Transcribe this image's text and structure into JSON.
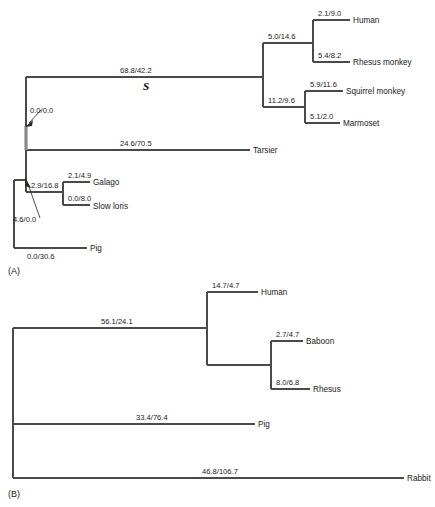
{
  "figure": {
    "panels": [
      {
        "id": "A",
        "label": "(A)",
        "node_marker": "S",
        "taxa": [
          "Human",
          "Rhesus monkey",
          "Squirrel monkey",
          "Marmoset",
          "Tarsier",
          "Galago",
          "Slow loris",
          "Pig"
        ],
        "branch_labels": [
          {
            "name": "human-branch-length",
            "text": "2.1/9.0"
          },
          {
            "name": "rhesus-monkey-branch-length",
            "text": "5.4/8.2"
          },
          {
            "name": "catarrhine-branch-length",
            "text": "5.0/14.6"
          },
          {
            "name": "squirrel-monkey-branch-length",
            "text": "5.9/11.6"
          },
          {
            "name": "marmoset-branch-length",
            "text": "5.1/2.0"
          },
          {
            "name": "platyrrhine-branch-length",
            "text": "11.2/9.6"
          },
          {
            "name": "anthropoid-branch-length",
            "text": "68.8/42.2"
          },
          {
            "name": "tarsier-branch-length",
            "text": "24.6/70.5"
          },
          {
            "name": "haplorhine-branch-length",
            "text": "0.0/0.0"
          },
          {
            "name": "galago-branch-length",
            "text": "2.1/4.9"
          },
          {
            "name": "slow-loris-branch-length",
            "text": "0.0/8.0"
          },
          {
            "name": "strepsirrhine-branch-length",
            "text": "2.9/16.8"
          },
          {
            "name": "primate-root-branch-length",
            "text": "4.6/0.0"
          },
          {
            "name": "pig-branch-length",
            "text": "0.0/30.6"
          }
        ]
      },
      {
        "id": "B",
        "label": "(B)",
        "taxa": [
          "Human",
          "Baboon",
          "Rhesus",
          "Pig",
          "Rabbit"
        ],
        "branch_labels": [
          {
            "name": "human-branch-length",
            "text": "14.7/4.7"
          },
          {
            "name": "baboon-branch-length",
            "text": "2.7/4.7"
          },
          {
            "name": "rhesus-branch-length",
            "text": "8.0/6.8"
          },
          {
            "name": "primate-branch-length",
            "text": "56.1/24.1"
          },
          {
            "name": "pig-branch-length",
            "text": "33.4/76.4"
          },
          {
            "name": "rabbit-branch-length",
            "text": "46.8/106.7"
          }
        ]
      }
    ],
    "panelA": {
      "label": "(A)",
      "node_marker": "S",
      "taxon_human": "Human",
      "taxon_rhesus_monkey": "Rhesus monkey",
      "taxon_squirrel_monkey": "Squirrel monkey",
      "taxon_marmoset": "Marmoset",
      "taxon_tarsier": "Tarsier",
      "taxon_galago": "Galago",
      "taxon_slow_loris": "Slow loris",
      "taxon_pig": "Pig",
      "len_human": "2.1/9.0",
      "len_rhesus_monkey": "5.4/8.2",
      "len_catarrhine": "5.0/14.6",
      "len_squirrel_monkey": "5.9/11.6",
      "len_marmoset": "5.1/2.0",
      "len_platyrrhine": "11.2/9.6",
      "len_anthropoid": "68.8/42.2",
      "len_tarsier": "24.6/70.5",
      "len_haplorhine": "0.0/0.0",
      "len_galago": "2.1/4.9",
      "len_slow_loris": "0.0/8.0",
      "len_strepsirrhine": "2.9/16.8",
      "len_primate_root": "4.6/0.0",
      "len_pig": "0.0/30.6"
    },
    "panelB": {
      "label": "(B)",
      "taxon_human": "Human",
      "taxon_baboon": "Baboon",
      "taxon_rhesus": "Rhesus",
      "taxon_pig": "Pig",
      "taxon_rabbit": "Rabbit",
      "len_human": "14.7/4.7",
      "len_baboon": "2.7/4.7",
      "len_rhesus": "8.0/6.8",
      "len_primate": "56.1/24.1",
      "len_pig": "33.4/76.4",
      "len_rabbit": "46.8/106.7"
    }
  }
}
